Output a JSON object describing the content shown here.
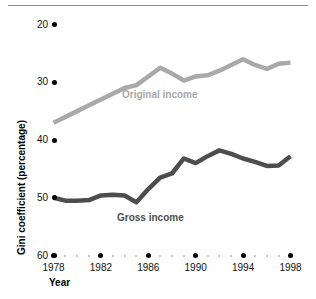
{
  "chart_data": {
    "type": "line",
    "title": "",
    "xlabel": "Year",
    "ylabel": "Gini coefficient (percentage)",
    "xlim": [
      1978,
      1998
    ],
    "ylim": [
      20,
      60
    ],
    "yticks": [
      20,
      30,
      40,
      50,
      60
    ],
    "xticks": [
      1978,
      1982,
      1986,
      1990,
      1994,
      1998
    ],
    "grid": false,
    "legend_position": "inline-labels",
    "x": [
      1978,
      1979,
      1980,
      1981,
      1982,
      1983,
      1984,
      1985,
      1986,
      1987,
      1988,
      1989,
      1990,
      1991,
      1992,
      1993,
      1994,
      1995,
      1996,
      1997,
      1998
    ],
    "series": [
      {
        "name": "Original income",
        "color": "#a9a9a9",
        "values": [
          43.0,
          44.0,
          45.0,
          46.0,
          47.0,
          48.0,
          49.0,
          49.5,
          51.0,
          52.5,
          51.5,
          50.3,
          51.0,
          51.2,
          52.0,
          53.0,
          54.0,
          53.0,
          52.3,
          53.2,
          53.4
        ]
      },
      {
        "name": "Gross income",
        "color": "#4d4d4d",
        "values": [
          30.0,
          29.5,
          29.5,
          29.6,
          30.4,
          30.5,
          30.4,
          29.2,
          31.5,
          33.5,
          34.2,
          36.8,
          36.0,
          37.2,
          38.2,
          37.6,
          36.8,
          36.2,
          35.5,
          35.6,
          37.2
        ]
      }
    ],
    "annotations": [
      {
        "text": "Original income",
        "x": 1987,
        "y": 48.5
      },
      {
        "text": "Gross income",
        "x": 1987,
        "y": 26.5
      }
    ]
  },
  "axes": {
    "y_tick_labels": [
      "60",
      "50",
      "40",
      "30",
      "20"
    ],
    "x_tick_labels": [
      "1978",
      "1982",
      "1986",
      "1990",
      "1994",
      "1998"
    ],
    "y_axis_title": "Gini coefficient (percentage)",
    "x_axis_title": "Year"
  },
  "series_labels": {
    "original": "Original income",
    "gross": "Gross income"
  },
  "colors": {
    "original_income": "#a9a9a9",
    "gross_income": "#4d4d4d",
    "tick_dot": "#000000",
    "minor_dot": "#b4b4b4",
    "rule": "#8a8a8a"
  }
}
